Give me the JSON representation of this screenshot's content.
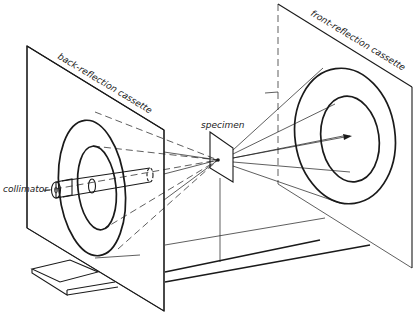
{
  "diagram": {
    "type": "x-ray diffraction camera schematic (perspective)",
    "labels": {
      "back_cassette": "back-reflection cassette",
      "front_cassette": "front-reflection cassette",
      "specimen": "specimen",
      "collimator": "collimator"
    },
    "components": [
      {
        "id": "back-reflection-cassette",
        "description": "left vertical plate with two concentric diffraction rings and collimator passing through"
      },
      {
        "id": "front-reflection-cassette",
        "description": "right vertical plate with two concentric diffraction rings, arrow marking direct beam"
      },
      {
        "id": "specimen",
        "description": "small flat plate at center on vertical post"
      },
      {
        "id": "collimator",
        "description": "cylindrical tube through back cassette"
      },
      {
        "id": "base-rail",
        "description": "long twin rails and a small base block under the apparatus"
      }
    ],
    "colors": {
      "ink": "#1a1a1a",
      "background": "#ffffff"
    }
  }
}
